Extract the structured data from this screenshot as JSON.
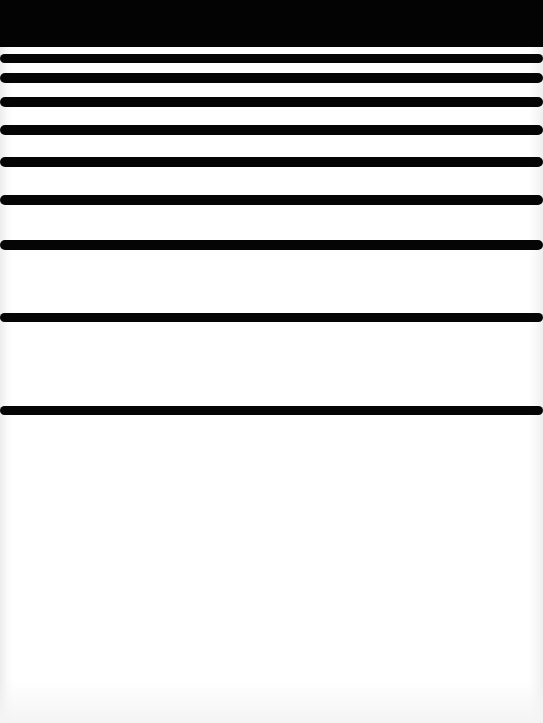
{
  "image": {
    "description": "Graded horizontal black stripes on white background; stripes spaced progressively wider toward the bottom",
    "colors": {
      "stripe": "#050505",
      "background": "#ffffff",
      "top_band": "#030303"
    },
    "stripe_count": 11
  }
}
